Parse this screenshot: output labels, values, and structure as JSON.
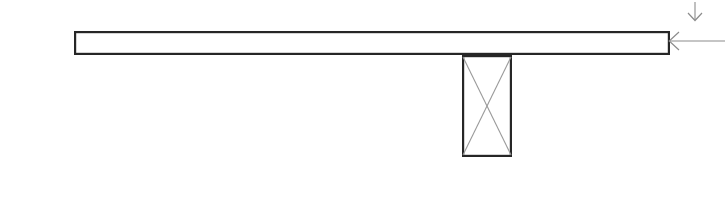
{
  "drawing": {
    "title": "Structural Connection Detail",
    "canvas": {
      "width": 725,
      "height": 199,
      "background_color": "#ffffff"
    },
    "colors": {
      "member_stroke": "#262626",
      "member_fill": "#ffffff",
      "bracing_stroke": "#9a9a9a",
      "annotation_stroke": "#8c8c8c"
    },
    "elements": [
      {
        "name": "horizontal-beam",
        "type": "rectangle",
        "description": "Long horizontal member shown in elevation",
        "x": 74,
        "y": 31,
        "width": 596,
        "height": 24,
        "stroke_width": 2.2
      },
      {
        "name": "vertical-column",
        "type": "rectangle",
        "description": "Vertical member below the beam with diagonal cross bracing",
        "x": 462,
        "y": 55,
        "width": 50,
        "height": 102,
        "stroke_width": 2.2
      },
      {
        "name": "cross-bracing",
        "type": "diagonals",
        "description": "X-shaped cross bracing inside the vertical member",
        "diagonal_1": {
          "x1": 463,
          "y1": 57,
          "x2": 511,
          "y2": 155
        },
        "diagonal_2": {
          "x1": 511,
          "y1": 57,
          "x2": 463,
          "y2": 155
        },
        "stroke_width": 1.1
      },
      {
        "name": "down-arrow-annotation",
        "type": "arrow",
        "description": "Vertical downward-pointing load or direction arrow at top right",
        "direction": "down",
        "shaft": {
          "x1": 695,
          "y1": 2,
          "x2": 695,
          "y2": 20
        },
        "head_size": 7,
        "stroke_width": 1.1
      },
      {
        "name": "leader-arrow-annotation",
        "type": "arrow",
        "description": "Horizontal leader line pointing left at the right end of the beam",
        "direction": "left",
        "shaft": {
          "x1": 725,
          "y1": 41,
          "x2": 670,
          "y2": 41
        },
        "head_size": 9,
        "stroke_width": 1.1
      }
    ]
  }
}
